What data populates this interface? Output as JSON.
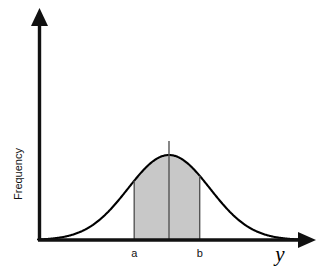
{
  "figure": {
    "title": "",
    "background_color": "#ffffff",
    "axes": {
      "y_axis_label": "Frequency",
      "x_axis_label": "y",
      "axis_color": "#111111",
      "arrowheads": "both-axes"
    },
    "tick_labels": {
      "lower_bound": "a",
      "upper_bound": "b"
    },
    "region": {
      "fill_color": "#c8c8c8",
      "edge_color": "#555555"
    },
    "curve": {
      "line_color": "#000000"
    },
    "mean_line": {
      "color": "#555555"
    }
  },
  "chart_data": {
    "type": "area",
    "title": "",
    "xlabel": "y",
    "ylabel": "Frequency",
    "curve_name": "normal density",
    "distribution": "normal",
    "mean": 0,
    "sigma": 1,
    "xlim": [
      -3.2,
      3.2
    ],
    "ylim": [
      0,
      1.12
    ],
    "grid": false,
    "legend": false,
    "shaded_region": {
      "label": "between a and b",
      "from": -0.85,
      "to": 0.75,
      "from_label": "a",
      "to_label": "b",
      "fill": "#c8c8c8"
    },
    "annotations": [
      {
        "text": "a",
        "x": -0.85,
        "y": 0,
        "position": "below-axis"
      },
      {
        "text": "b",
        "x": 0.75,
        "y": 0,
        "position": "below-axis"
      },
      {
        "text": "y",
        "x": 3.1,
        "y": 0,
        "position": "below-axis-right"
      },
      {
        "text": "Frequency",
        "x": -3.2,
        "y": 0.55,
        "position": "rotated-y-axis"
      }
    ],
    "x": [
      -3.2,
      -3.0,
      -2.8,
      -2.6,
      -2.4,
      -2.2,
      -2.0,
      -1.8,
      -1.6,
      -1.4,
      -1.2,
      -1.0,
      -0.8,
      -0.6,
      -0.4,
      -0.2,
      0.0,
      0.2,
      0.4,
      0.6,
      0.8,
      1.0,
      1.2,
      1.4,
      1.6,
      1.8,
      2.0,
      2.2,
      2.4,
      2.6,
      2.8,
      3.0,
      3.2
    ],
    "y": [
      0.006,
      0.011,
      0.02,
      0.034,
      0.056,
      0.089,
      0.135,
      0.198,
      0.278,
      0.375,
      0.487,
      0.607,
      0.726,
      0.835,
      0.923,
      0.98,
      1.0,
      0.98,
      0.923,
      0.835,
      0.726,
      0.607,
      0.487,
      0.375,
      0.278,
      0.198,
      0.135,
      0.089,
      0.056,
      0.034,
      0.02,
      0.011,
      0.006
    ]
  }
}
